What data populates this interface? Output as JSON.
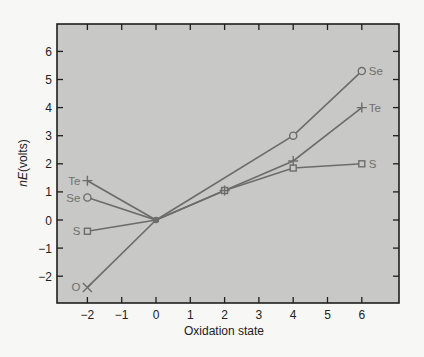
{
  "chart_data": {
    "type": "line",
    "title": "",
    "xlabel": "Oxidation state",
    "ylabel_italic": "nE",
    "ylabel_rest": "(volts)",
    "ylabel": "nE(volts)",
    "xlim": [
      -3,
      7
    ],
    "ylim": [
      -3,
      7
    ],
    "xticks": [
      -2,
      -1,
      0,
      1,
      2,
      3,
      4,
      5,
      6
    ],
    "yticks": [
      -2,
      -1,
      0,
      1,
      2,
      3,
      4,
      5,
      6
    ],
    "grid": false,
    "legend": "inline labels at line ends",
    "series": [
      {
        "name": "O",
        "marker": "x",
        "points": [
          [
            -2,
            -2.4
          ],
          [
            0,
            0
          ]
        ]
      },
      {
        "name": "S",
        "marker": "square",
        "points": [
          [
            -2,
            -0.4
          ],
          [
            0,
            0
          ],
          [
            2,
            1.05
          ],
          [
            4,
            1.85
          ],
          [
            6,
            2.0
          ]
        ]
      },
      {
        "name": "Se",
        "marker": "circle",
        "points": [
          [
            -2,
            0.8
          ],
          [
            0,
            0
          ],
          [
            4,
            3.0
          ],
          [
            6,
            5.3
          ]
        ]
      },
      {
        "name": "Te",
        "marker": "plus",
        "points": [
          [
            -2,
            1.4
          ],
          [
            0,
            0
          ],
          [
            2,
            1.05
          ],
          [
            4,
            2.1
          ],
          [
            6,
            4.0
          ]
        ]
      }
    ],
    "labels": [
      {
        "text": "Te",
        "anchor": [
          -2,
          1.4
        ],
        "side": "left"
      },
      {
        "text": "Se",
        "anchor": [
          -2,
          0.8
        ],
        "side": "left"
      },
      {
        "text": "S",
        "anchor": [
          -2,
          -0.4
        ],
        "side": "left"
      },
      {
        "text": "O",
        "anchor": [
          -2,
          -2.4
        ],
        "side": "left"
      },
      {
        "text": "Se",
        "anchor": [
          6,
          5.3
        ],
        "side": "right"
      },
      {
        "text": "Te",
        "anchor": [
          6,
          4.0
        ],
        "side": "right"
      },
      {
        "text": "S",
        "anchor": [
          6,
          2.0
        ],
        "side": "right"
      }
    ]
  },
  "colors": {
    "plot_bg": "#c8c8c6",
    "frame": "#1e1e1e",
    "line": "#6c6c6c",
    "series_label": "#6f6f6f"
  }
}
